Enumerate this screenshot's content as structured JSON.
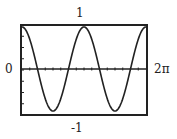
{
  "chart_data": {
    "type": "line",
    "title": "",
    "xlabel": "",
    "ylabel": "",
    "function": "cos(2x)",
    "xlim": [
      0,
      6.2832
    ],
    "ylim": [
      -1,
      1
    ],
    "grid": false,
    "labels": {
      "top": "1",
      "bottom": "-1",
      "left": "0",
      "right": "2π"
    },
    "series": [
      {
        "name": "y = cos(2x)",
        "x": [
          0,
          0.3927,
          0.7854,
          1.1781,
          1.5708,
          1.9635,
          2.3562,
          2.7489,
          3.1416,
          3.5343,
          3.927,
          4.3197,
          4.7124,
          5.1051,
          5.4978,
          5.8905,
          6.2832
        ],
        "values": [
          1,
          0.707,
          0,
          -0.707,
          -1,
          -0.707,
          0,
          0.707,
          1,
          0.707,
          0,
          -0.707,
          -1,
          -0.707,
          0,
          0.707,
          1
        ]
      }
    ],
    "x_ticks_count": 16,
    "y_ticks_count": 8
  },
  "colors": {
    "line": "#222222",
    "frame": "#222222",
    "background": "#ffffff"
  }
}
